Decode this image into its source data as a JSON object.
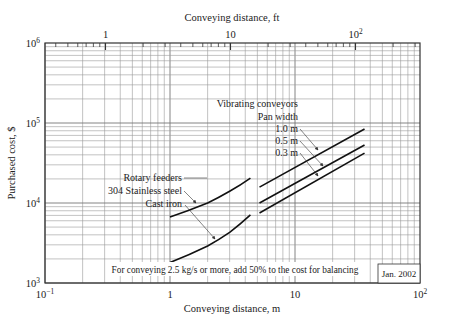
{
  "chart_data": {
    "type": "line",
    "title": "",
    "xlabel": "Conveying distance, m",
    "x2label": "Conveying distance, ft",
    "ylabel": "Purchased cost, $",
    "xscale": "log",
    "yscale": "log",
    "xlim": [
      0.1,
      100
    ],
    "ylim": [
      1000,
      1000000
    ],
    "grid": true,
    "x_ticks": [
      {
        "value": 0.1,
        "base": "10",
        "exp": "−1"
      },
      {
        "value": 1,
        "base": "1",
        "exp": ""
      },
      {
        "value": 10,
        "base": "10",
        "exp": ""
      },
      {
        "value": 100,
        "base": "10",
        "exp": "2"
      }
    ],
    "x2_ticks_ft": [
      {
        "value_ft": 1,
        "base": "1",
        "exp": ""
      },
      {
        "value_ft": 10,
        "base": "10",
        "exp": ""
      },
      {
        "value_ft": 100,
        "base": "10",
        "exp": "2"
      }
    ],
    "y_ticks": [
      {
        "value": 1000,
        "base": "10",
        "exp": "3"
      },
      {
        "value": 10000,
        "base": "10",
        "exp": "4"
      },
      {
        "value": 100000,
        "base": "10",
        "exp": "5"
      },
      {
        "value": 1000000,
        "base": "10",
        "exp": "6"
      }
    ],
    "series": [
      {
        "name": "Rotary feeders, 304 Stainless steel",
        "group": "Rotary feeders",
        "x": [
          1.0,
          2.0,
          3.0,
          4.4
        ],
        "y": [
          6700,
          10000,
          14000,
          20500
        ]
      },
      {
        "name": "Rotary feeders, Cast iron",
        "group": "Rotary feeders",
        "x": [
          1.0,
          2.0,
          3.0,
          4.4
        ],
        "y": [
          1800,
          2900,
          4300,
          7100
        ]
      },
      {
        "name": "Vibrating conveyors, Pan width 1.0 m",
        "group": "Vibrating conveyors",
        "x": [
          5.2,
          36
        ],
        "y": [
          15800,
          84000
        ]
      },
      {
        "name": "Vibrating conveyors, Pan width 0.5 m",
        "group": "Vibrating conveyors",
        "x": [
          5.2,
          36
        ],
        "y": [
          10000,
          53000
        ]
      },
      {
        "name": "Vibrating conveyors, Pan width 0.3 m",
        "group": "Vibrating conveyors",
        "x": [
          5.2,
          36
        ],
        "y": [
          7500,
          42000
        ]
      }
    ],
    "annotations": {
      "rotary_title": "Rotary feeders",
      "rotary_ss": "304 Stainless steel",
      "rotary_ci": "Cast iron",
      "vib_title": "Vibrating conveyors",
      "vib_sub": "Pan width",
      "vib_10": "1.0 m",
      "vib_05": "0.5 m",
      "vib_03": "0.3 m",
      "note": "For conveying 2.5 kg/s or more, add 50% to the cost for balancing",
      "date": "Jan. 2002"
    }
  }
}
